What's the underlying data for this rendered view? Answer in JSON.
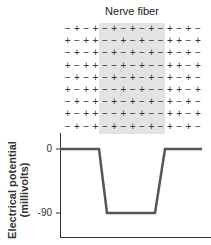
{
  "diagram": {
    "title": "Nerve fiber",
    "charge_rows": [
      "-+-+-+-+-+-+-+-",
      "+-++--+-+--++-+",
      "-+-+-+-+-+-+-+-",
      "+-++--+-+--++-+",
      "-+-+-+-+-+-+-+-",
      "+-++--+-+--++-+",
      "-+-+-+-+-+-+-+-",
      "+-++--+-+--++-+",
      "-+-+-+-+-+-+-+-"
    ],
    "shaded_columns": [
      4,
      10
    ],
    "colors": {
      "shade": "#e3e3e3",
      "line": "#555555",
      "axis": "#333333"
    }
  },
  "chart_data": {
    "type": "line",
    "title": "",
    "xlabel": "",
    "ylabel": "Electrical potential (millivolts)",
    "ylabel_lines": [
      "Electrical potential",
      "(millivolts)"
    ],
    "yticks": [
      "0",
      "-90"
    ],
    "ylim": [
      -90,
      0
    ],
    "x": [
      0,
      39,
      47,
      95,
      105,
      142
    ],
    "values": [
      0,
      0,
      -90,
      -90,
      0,
      0
    ],
    "grid": false
  }
}
